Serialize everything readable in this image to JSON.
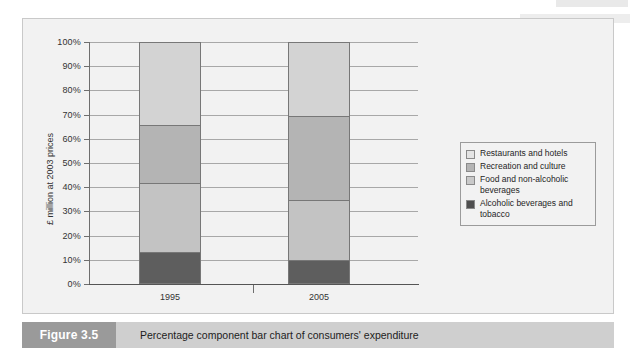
{
  "figure": {
    "number_label": "Figure 3.5",
    "caption": "Percentage component bar chart of consumers' expenditure",
    "ghost_text": ""
  },
  "chart_data": {
    "type": "bar",
    "stacked": true,
    "title": "",
    "xlabel": "",
    "ylabel": "£ million at 2003 prices",
    "categories": [
      "1995",
      "2005"
    ],
    "ylim": [
      0,
      100
    ],
    "ytick_labels": [
      "100%",
      "90%",
      "80%",
      "70%",
      "60%",
      "50%",
      "40%",
      "30%",
      "20%",
      "10%",
      "0%"
    ],
    "ytick_values": [
      100,
      90,
      80,
      70,
      60,
      50,
      40,
      30,
      20,
      10,
      0
    ],
    "grid": true,
    "legend_position": "right",
    "series": [
      {
        "name": "Restaurants and hotels",
        "color": "#d3d3d3",
        "values": [
          34.4,
          30.6
        ]
      },
      {
        "name": "Recreation and culture",
        "color": "#b4b4b4",
        "values": [
          23.9,
          34.7
        ]
      },
      {
        "name": "Food and non-alcoholic beverages",
        "color": "#c3c3c3",
        "values": [
          28.5,
          24.7
        ]
      },
      {
        "name": "Alcoholic beverages and tobacco",
        "color": "#5e5e5e",
        "values": [
          13.2,
          10.0
        ]
      }
    ]
  },
  "legend": {
    "items": [
      {
        "label": "Restaurants and hotels",
        "color": "#e4e4e4"
      },
      {
        "label": "Recreation and culture",
        "color": "#b4b4b4"
      },
      {
        "label": "Food and non-alcoholic beverages",
        "color": "#c9c9c9"
      },
      {
        "label": "Alcoholic beverages and tobacco",
        "color": "#4f4f4f"
      }
    ]
  }
}
